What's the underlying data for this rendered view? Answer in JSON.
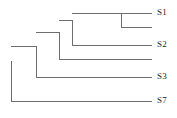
{
  "figure": {
    "type": "phylogenetic-tree",
    "orientation": "left-to-right",
    "background_color": "#ffffff",
    "line_color": "#6e6e6e",
    "line_width": 1,
    "label_color": "#1c1c1c"
  },
  "chart_data": {
    "type": "tree",
    "title": "",
    "xlabel": "",
    "ylabel": "",
    "grid": false,
    "legend": "none",
    "leaf_count": 6,
    "labeled_leaf_count": 4,
    "tip_labels": [
      "S1",
      "S2",
      "S3",
      "S7"
    ],
    "leaves": [
      {
        "id": "leaf1",
        "label": "S1",
        "y": 13,
        "branch_start_x": 121,
        "tip_x": 152
      },
      {
        "id": "leaf2",
        "label": "",
        "y": 27,
        "branch_start_x": 121,
        "tip_x": 152
      },
      {
        "id": "leaf3",
        "label": "S2",
        "y": 45,
        "branch_start_x": 72,
        "tip_x": 152
      },
      {
        "id": "leaf4",
        "label": "",
        "y": 59,
        "branch_start_x": 59,
        "tip_x": 152
      },
      {
        "id": "leaf5",
        "label": "S3",
        "y": 77,
        "branch_start_x": 36,
        "tip_x": 152
      },
      {
        "id": "leaf6",
        "label": "S7",
        "y": 101,
        "branch_start_x": 11,
        "tip_x": 152
      }
    ],
    "internal_nodes": [
      {
        "id": "node_A",
        "x": 121,
        "y_top": 13,
        "y_bottom": 27,
        "parent_x": 72,
        "y": 20,
        "children": [
          "leaf1",
          "leaf2"
        ]
      },
      {
        "id": "node_B",
        "x": 72,
        "y_top": 20,
        "y_bottom": 45,
        "parent_x": 59,
        "y": 32,
        "children": [
          "node_A",
          "leaf3"
        ]
      },
      {
        "id": "node_C",
        "x": 59,
        "y_top": 32,
        "y_bottom": 59,
        "parent_x": 36,
        "y": 46,
        "children": [
          "node_B",
          "leaf4"
        ]
      },
      {
        "id": "node_D",
        "x": 36,
        "y_top": 46,
        "y_bottom": 77,
        "parent_x": 11,
        "y": 61,
        "children": [
          "node_C",
          "leaf5"
        ]
      },
      {
        "id": "node_root",
        "x": 11,
        "y_top": 61,
        "y_bottom": 101,
        "parent_x": 11,
        "y": 81,
        "children": [
          "node_D",
          "leaf6"
        ]
      }
    ],
    "labels": [
      {
        "text": "S1",
        "x": 157,
        "y": 8
      },
      {
        "text": "S2",
        "x": 157,
        "y": 40
      },
      {
        "text": "S3",
        "x": 157,
        "y": 72
      },
      {
        "text": "S7",
        "x": 157,
        "y": 96
      }
    ]
  }
}
